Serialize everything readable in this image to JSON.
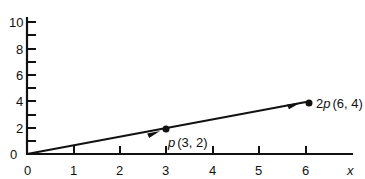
{
  "chart_data": {
    "type": "line",
    "title": "",
    "xlabel": "x",
    "ylabel": "",
    "xlim": [
      0,
      6.5
    ],
    "ylim": [
      0,
      10
    ],
    "x_ticks": [
      0,
      1,
      2,
      3,
      4,
      5,
      6
    ],
    "x_tick_labels": [
      "0",
      "1",
      "2",
      "3",
      "4",
      "5",
      "6"
    ],
    "y_ticks": [
      0,
      1,
      2,
      3,
      4,
      5,
      6,
      7,
      8,
      9,
      10
    ],
    "y_tick_labels": [
      "0",
      "2",
      "4",
      "6",
      "8",
      "10"
    ],
    "grid": false,
    "series": [
      {
        "name": "vector p",
        "x": [
          0,
          3
        ],
        "y": [
          0,
          2
        ],
        "arrow": true
      },
      {
        "name": "vector 2p",
        "x": [
          3,
          6
        ],
        "y": [
          2,
          4
        ],
        "arrow": true
      }
    ],
    "points": [
      {
        "label_prefix": "p",
        "label_coords": "(3, 2)",
        "x": 3,
        "y": 2
      },
      {
        "label_prefix": "2p",
        "label_coords": "(6, 4)",
        "x": 6,
        "y": 4
      }
    ]
  },
  "labels": {
    "x_axis": "x",
    "origin": "0",
    "p_name": "p",
    "p_coords": "(3, 2)",
    "p2_name": "2p",
    "p2_coords": "(6, 4)"
  }
}
